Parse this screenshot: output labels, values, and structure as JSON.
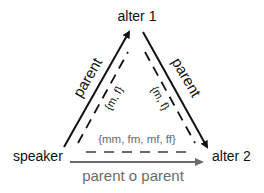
{
  "nodes": {
    "alter1": "alter 1",
    "speaker": "speaker",
    "alter2": "alter 2"
  },
  "edges": {
    "left": {
      "label": "parent",
      "set": "{m, f}"
    },
    "right": {
      "label": "parent",
      "set": "{m, f}"
    },
    "bottom": {
      "label": "parent o parent",
      "set": "{mm, fm, mf, ff}"
    }
  },
  "colors": {
    "primary": "#111111",
    "composite": "#6b6b6b"
  }
}
